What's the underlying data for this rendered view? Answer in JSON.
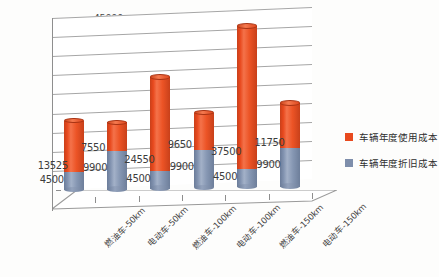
{
  "chart_data": {
    "type": "bar",
    "subtype": "stacked-3d-cylinder",
    "title": "",
    "xlabel": "",
    "ylabel": "",
    "ylim": [
      0,
      45000
    ],
    "ytick_step": 5000,
    "yticks": [
      "0",
      "5000",
      "10000",
      "15000",
      "20000",
      "25000",
      "30000",
      "35000",
      "40000",
      "45000"
    ],
    "grid": true,
    "legend_position": "right",
    "categories": [
      "燃油车-50km",
      "电动车-50km",
      "燃油车-100km",
      "电动车-100km",
      "燃油车-150km",
      "电动车-150km"
    ],
    "series": [
      {
        "name": "车辆年度折旧成本",
        "color": "#7e8eab",
        "values": [
          4500,
          9900,
          4500,
          9900,
          4500,
          9900
        ],
        "labels": [
          "4500",
          "9900",
          "4500",
          "9900",
          "4500",
          "9900"
        ]
      },
      {
        "name": "车辆年度使用成本",
        "color": "#e8491e",
        "values": [
          13525,
          7550,
          24550,
          9650,
          37500,
          11750
        ],
        "labels": [
          "13525",
          "7550",
          "24550",
          "9650",
          "37500",
          "11750"
        ]
      }
    ],
    "totals": [
      18025,
      17450,
      29050,
      19550,
      42000,
      21650
    ]
  },
  "legend": {
    "items": [
      {
        "label": "车辆年度使用成本",
        "color": "#e8491e"
      },
      {
        "label": "车辆年度折旧成本",
        "color": "#7e8eab"
      }
    ]
  }
}
